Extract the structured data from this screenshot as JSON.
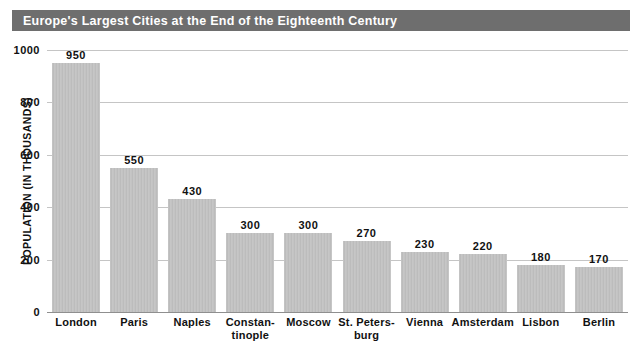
{
  "header": {
    "title": "Europe's Largest Cities at the End of the Eighteenth Century",
    "bar_color": "#6e6e6e",
    "text_color": "#ffffff"
  },
  "chart_data": {
    "type": "bar",
    "title": "Europe's Largest Cities at the End of the Eighteenth Century",
    "xlabel": "",
    "ylabel": "POPULATION (IN THOUSANDS)",
    "ylim": [
      0,
      1000
    ],
    "yticks": [
      0,
      200,
      400,
      600,
      800,
      1000
    ],
    "ytick_labels": [
      "0",
      "200",
      "400",
      "600",
      "800",
      "1000"
    ],
    "grid": true,
    "legend": null,
    "bar_color": "#c3c3c3",
    "categories": [
      "London",
      "Paris",
      "Naples",
      "Constantinople",
      "Moscow",
      "St. Petersburg",
      "Vienna",
      "Amsterdam",
      "Lisbon",
      "Berlin"
    ],
    "category_label_lines": [
      [
        "London"
      ],
      [
        "Paris"
      ],
      [
        "Naples"
      ],
      [
        "Constan-",
        "tinople"
      ],
      [
        "Moscow"
      ],
      [
        "St. Peters-",
        "burg"
      ],
      [
        "Vienna"
      ],
      [
        "Amsterdam"
      ],
      [
        "Lisbon"
      ],
      [
        "Berlin"
      ]
    ],
    "values": [
      950,
      550,
      430,
      300,
      300,
      270,
      230,
      220,
      180,
      170
    ],
    "value_labels": [
      "950",
      "550",
      "430",
      "300",
      "300",
      "270",
      "230",
      "220",
      "180",
      "170"
    ]
  }
}
